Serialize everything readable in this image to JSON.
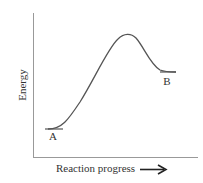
{
  "diagram": {
    "type": "energy-profile",
    "y_axis_label": "Energy",
    "x_axis_label": "Reaction progress",
    "points": [
      {
        "label": "A",
        "role": "reactant",
        "relative_energy": "low"
      },
      {
        "label": "B",
        "role": "product",
        "relative_energy": "medium"
      }
    ],
    "peak": {
      "role": "transition-state",
      "relative_energy": "high"
    },
    "colors": {
      "curve": "#555555",
      "axes": "#888888",
      "text": "#333333"
    }
  }
}
